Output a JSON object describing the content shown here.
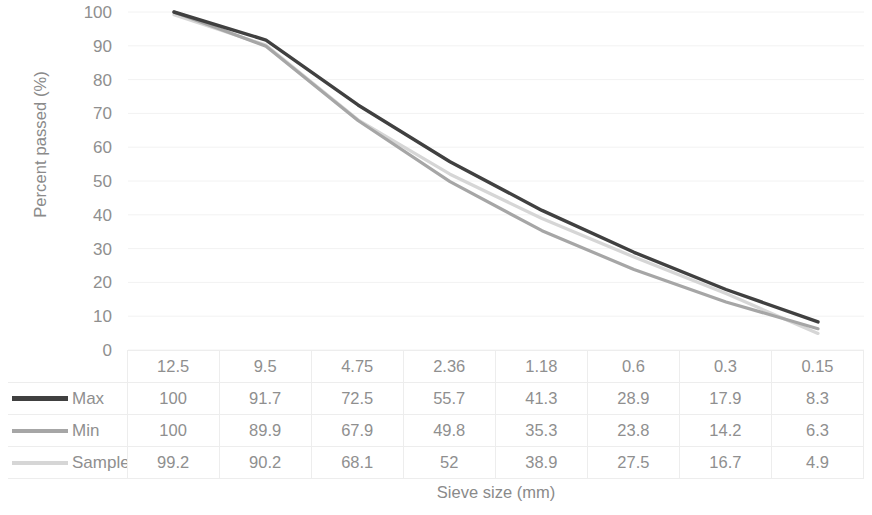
{
  "chart_data": {
    "type": "line",
    "title": "",
    "xlabel": "Sieve size (mm)",
    "ylabel": "Percent passed (%)",
    "categories": [
      "12.5",
      "9.5",
      "4.75",
      "2.36",
      "1.18",
      "0.6",
      "0.3",
      "0.15"
    ],
    "ylim": [
      0,
      100
    ],
    "ytick_labels": [
      "100",
      "90",
      "80",
      "70",
      "60",
      "50",
      "40",
      "30",
      "20",
      "10",
      "0"
    ],
    "ytick_values": [
      100,
      90,
      80,
      70,
      60,
      50,
      40,
      30,
      20,
      10,
      0
    ],
    "grid": true,
    "legend_position": "table-left-column",
    "series": [
      {
        "name": "Max",
        "color": "#404040",
        "values": [
          100,
          91.7,
          72.5,
          55.7,
          41.3,
          28.9,
          17.9,
          8.3
        ],
        "display_values": [
          "100",
          "91.7",
          "72.5",
          "55.7",
          "41.3",
          "28.9",
          "17.9",
          "8.3"
        ]
      },
      {
        "name": "Min",
        "color": "#a6a6a6",
        "values": [
          100,
          89.9,
          67.9,
          49.8,
          35.3,
          23.8,
          14.2,
          6.3
        ],
        "display_values": [
          "100",
          "89.9",
          "67.9",
          "49.8",
          "35.3",
          "23.8",
          "14.2",
          "6.3"
        ]
      },
      {
        "name": "Sample",
        "color": "#d6d6d6",
        "values": [
          99.2,
          90.2,
          68.1,
          52,
          38.9,
          27.5,
          16.7,
          4.9
        ],
        "display_values": [
          "99.2",
          "90.2",
          "68.1",
          "52",
          "38.9",
          "27.5",
          "16.7",
          "4.9"
        ]
      }
    ]
  },
  "table": {
    "header_corner": "",
    "column_headers": [
      "12.5",
      "9.5",
      "4.75",
      "2.36",
      "1.18",
      "0.6",
      "0.3",
      "0.15"
    ],
    "rows": [
      {
        "label": "Max",
        "cells": [
          "100",
          "91.7",
          "72.5",
          "55.7",
          "41.3",
          "28.9",
          "17.9",
          "8.3"
        ]
      },
      {
        "label": "Min",
        "cells": [
          "100",
          "89.9",
          "67.9",
          "49.8",
          "35.3",
          "23.8",
          "14.2",
          "6.3"
        ]
      },
      {
        "label": "Sample",
        "cells": [
          "99.2",
          "90.2",
          "68.1",
          "52",
          "38.9",
          "27.5",
          "16.7",
          "4.9"
        ]
      }
    ]
  },
  "axes": {
    "y_title": "Percent passed (%)",
    "x_title": "Sieve size (mm)"
  },
  "colors": {
    "max": "#404040",
    "min": "#a6a6a6",
    "sample": "#d6d6d6",
    "grid": "#f2f2f2",
    "text": "#8f8f8f",
    "background": "#ffffff"
  }
}
